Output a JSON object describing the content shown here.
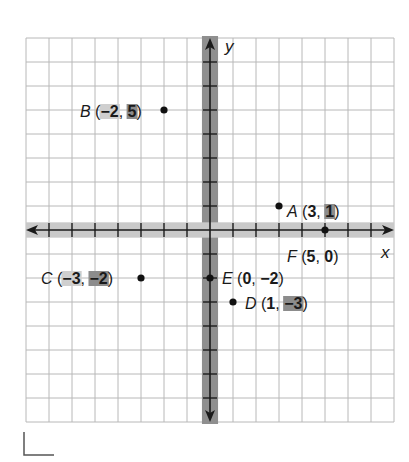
{
  "figure": {
    "axis_labels": {
      "x": "x",
      "y": "y"
    },
    "colors": {
      "grid": "#b8b8b8",
      "x_band": "#c9c9c9",
      "y_band": "#8f8f8f",
      "x_highlight": "#cfcfcf",
      "y_highlight": "#8c8c8c",
      "axis": "#1a1a1a"
    },
    "grid": {
      "x_min": -8,
      "x_max": 8,
      "y_min": -8,
      "y_max": 8
    },
    "points": [
      {
        "name": "A",
        "x": 3,
        "y": 1,
        "x_text": "3",
        "y_text": "1",
        "hl_x": false,
        "hl_y": true,
        "label_side": "right"
      },
      {
        "name": "B",
        "x": -2,
        "y": 5,
        "x_text": "−2",
        "y_text": "5",
        "hl_x": true,
        "hl_y": true,
        "label_side": "left"
      },
      {
        "name": "C",
        "x": -3,
        "y": -2,
        "x_text": "−3",
        "y_text": "−2",
        "hl_x": true,
        "hl_y": true,
        "label_side": "left"
      },
      {
        "name": "D",
        "x": 1,
        "y": -3,
        "x_text": "1",
        "y_text": "−3",
        "hl_x": false,
        "hl_y": true,
        "label_side": "right"
      },
      {
        "name": "E",
        "x": 0,
        "y": -2,
        "x_text": "0",
        "y_text": "−2",
        "hl_x": false,
        "hl_y": false,
        "label_side": "right"
      },
      {
        "name": "F",
        "x": 5,
        "y": 0,
        "x_text": "5",
        "y_text": "0",
        "hl_x": false,
        "hl_y": false,
        "label_side": "below"
      }
    ]
  },
  "chart_data": {
    "type": "scatter",
    "title": "",
    "xlabel": "x",
    "ylabel": "y",
    "xlim": [
      -8,
      8
    ],
    "ylim": [
      -8,
      8
    ],
    "grid": true,
    "series": [
      {
        "name": "points",
        "labels": [
          "A",
          "B",
          "C",
          "D",
          "E",
          "F"
        ],
        "x": [
          3,
          -2,
          -3,
          1,
          0,
          5
        ],
        "y": [
          1,
          5,
          -2,
          -3,
          -2,
          0
        ]
      }
    ],
    "annotations": [
      "A (3, 1)",
      "B (−2, 5)",
      "C (−3, −2)",
      "D (1, −3)",
      "E (0, −2)",
      "F (5, 0)"
    ]
  }
}
